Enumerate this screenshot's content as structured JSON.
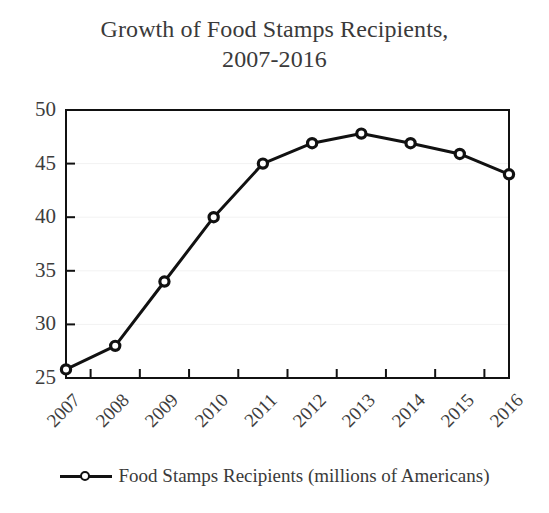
{
  "chart_data": {
    "type": "line",
    "title": "Growth of Food Stamps Recipients, 2007-2016",
    "title_lines": [
      "Growth of Food Stamps Recipients,",
      "2007-2016"
    ],
    "xlabel": "",
    "ylabel": "",
    "categories": [
      "2007",
      "2008",
      "2009",
      "2010",
      "2011",
      "2012",
      "2013",
      "2014",
      "2015",
      "2016"
    ],
    "series": [
      {
        "name": "Food Stamps Recipients (millions of Americans)",
        "values": [
          25.8,
          28.0,
          34.0,
          40.0,
          45.0,
          46.9,
          47.8,
          46.9,
          45.9,
          44.0
        ]
      }
    ],
    "ylim": [
      25,
      50
    ],
    "yticks": [
      25,
      30,
      35,
      40,
      45,
      50
    ],
    "ytick_labels": [
      "25",
      "30",
      "35",
      "40",
      "45",
      "50"
    ],
    "grid": false,
    "legend_position": "bottom",
    "legend_entries": [
      "Food Stamps Recipients (millions of Americans)"
    ],
    "colors": {
      "line": "#111111",
      "marker_fill": "#ffffff",
      "marker_stroke": "#111111",
      "axis": "#111111",
      "text": "#3a3a3a",
      "background": "#ffffff"
    }
  }
}
